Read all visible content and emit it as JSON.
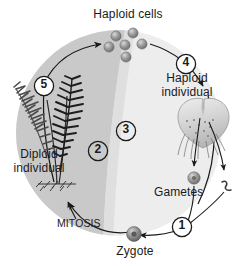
{
  "diagram": {
    "type": "life-cycle",
    "labels": {
      "haploid_cells": "Haploid cells",
      "haploid_individual_line1": "Haploid",
      "haploid_individual_line2": "individual",
      "gametes": "Gametes",
      "zygote": "Zygote",
      "mitosis": "MITOSIS",
      "diploid_individual_line1": "Diploid",
      "diploid_individual_line2": "individual"
    },
    "steps": [
      {
        "id": "1",
        "marker": "1",
        "meaning": "fertilization"
      },
      {
        "id": "2",
        "marker": "2",
        "meaning": "diploid phase"
      },
      {
        "id": "3",
        "marker": "3",
        "meaning": "haploid phase"
      },
      {
        "id": "4",
        "marker": "4",
        "meaning": "spore develops into gametophyte"
      },
      {
        "id": "5",
        "marker": "5",
        "meaning": "meiosis producing haploid cells"
      }
    ],
    "spore_count": 6,
    "colors": {
      "diploid_region": "#c9c9c9",
      "haploid_region": "#ececec",
      "outline": "#1a1a1a",
      "cell_fill": "#8f8f8f",
      "fern": "#2b2b2b",
      "gametophyte": "#cfcfcf"
    }
  }
}
